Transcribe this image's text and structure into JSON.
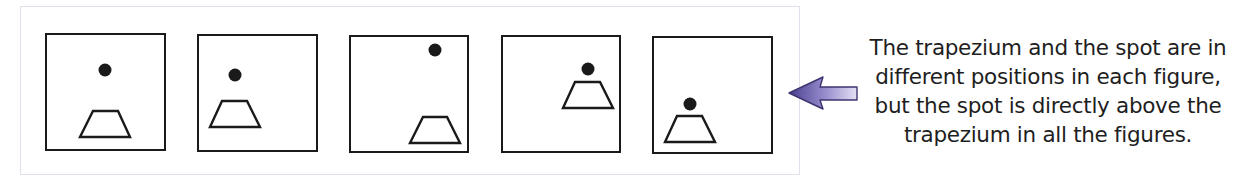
{
  "figures": [
    {
      "label": "figure-1",
      "box": {
        "x": 45,
        "y": 33,
        "w": 121,
        "h": 118
      },
      "dot": {
        "cx": 105,
        "cy": 70,
        "r": 6.5
      },
      "trapezium": {
        "top_left": [
          93,
          111
        ],
        "top_right": [
          118,
          111
        ],
        "bottom_right": [
          130,
          137
        ],
        "bottom_left": [
          80,
          137
        ]
      }
    },
    {
      "label": "figure-2",
      "box": {
        "x": 197,
        "y": 34,
        "w": 121,
        "h": 118
      },
      "dot": {
        "cx": 235,
        "cy": 75,
        "r": 6.5
      },
      "trapezium": {
        "top_left": [
          222,
          101
        ],
        "top_right": [
          247,
          101
        ],
        "bottom_right": [
          260,
          127
        ],
        "bottom_left": [
          210,
          127
        ]
      }
    },
    {
      "label": "figure-3",
      "box": {
        "x": 349,
        "y": 35,
        "w": 120,
        "h": 118
      },
      "dot": {
        "cx": 435,
        "cy": 50,
        "r": 6.5
      },
      "trapezium": {
        "top_left": [
          423,
          117
        ],
        "top_right": [
          447,
          117
        ],
        "bottom_right": [
          460,
          143
        ],
        "bottom_left": [
          410,
          143
        ]
      }
    },
    {
      "label": "figure-4",
      "box": {
        "x": 501,
        "y": 35,
        "w": 120,
        "h": 118
      },
      "dot": {
        "cx": 588,
        "cy": 69,
        "r": 6.5
      },
      "trapezium": {
        "top_left": [
          575,
          82
        ],
        "top_right": [
          600,
          82
        ],
        "bottom_right": [
          613,
          108
        ],
        "bottom_left": [
          563,
          108
        ]
      }
    },
    {
      "label": "figure-5",
      "box": {
        "x": 652,
        "y": 36,
        "w": 121,
        "h": 118
      },
      "dot": {
        "cx": 690,
        "cy": 104,
        "r": 6.5
      },
      "trapezium": {
        "top_left": [
          677,
          116
        ],
        "top_right": [
          702,
          116
        ],
        "bottom_right": [
          715,
          142
        ],
        "bottom_left": [
          665,
          142
        ]
      }
    }
  ],
  "arrow": {
    "direction": "left",
    "icon": "arrow-left-icon",
    "color_dark": "#4a3f8f",
    "color_light": "#e4e1f3"
  },
  "caption": {
    "lines": [
      "The trapezium and the spot are in",
      "different positions in each figure,",
      "but the spot is directly above the",
      "trapezium in all the figures."
    ]
  },
  "colors": {
    "frame_border": "#dfe2ea",
    "figure_stroke": "#1a1a1a",
    "text": "#1e1e1e"
  }
}
